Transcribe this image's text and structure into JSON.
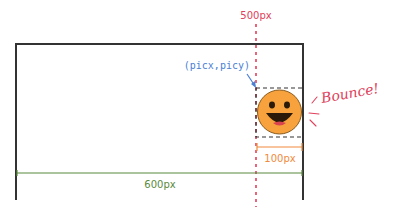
{
  "labels": {
    "limit": "500px",
    "position": "(picx,picy)",
    "bounce": "Bounce!",
    "image_width": "100px",
    "canvas_width": "600px"
  },
  "colors": {
    "canvas_border": "#333333",
    "limit_line": "#e0405a",
    "position_label": "#4a7fd4",
    "bounce_text": "#e0405a",
    "image_width": "#f08a3c",
    "canvas_width": "#5a8a3c",
    "smiley_face": "#f7a23c",
    "smiley_outline": "#8a5a1a"
  }
}
